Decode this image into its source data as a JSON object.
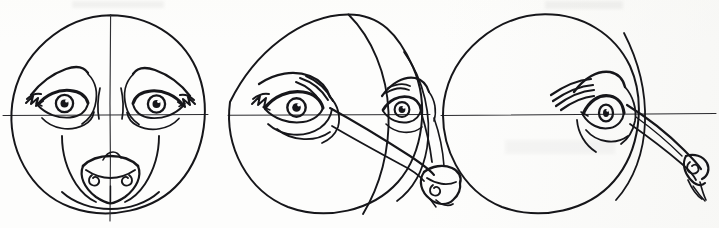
{
  "document": {
    "title": "Canine Head Construction Sketch",
    "medium": "pen and ink on paper",
    "subject": "wolf / dog head turnaround study",
    "panel_count": 3,
    "background_color": "#fdfdfc",
    "ink_color": "#16161a",
    "guide_color": "#2a2a2e",
    "canvas": {
      "width": 719,
      "height": 228
    }
  },
  "guides": {
    "eye_line_label": "horizontal eye line",
    "eye_line_y": 115,
    "eye_line_x_start": 3,
    "eye_line_x_end": 716,
    "center_line_label": "vertical center line"
  },
  "panels": [
    {
      "id": "panel-1",
      "view": "front view",
      "rotation_degrees": 0,
      "circle": {
        "cx": 110,
        "cy": 114,
        "r": 99
      },
      "center_line": {
        "type": "straight",
        "x_top": 110,
        "x_bottom": 110
      },
      "features": [
        "left eye",
        "right eye",
        "left brow",
        "right brow",
        "muzzle",
        "nose",
        "cheek lines"
      ],
      "eyes_visible": 2,
      "nose_visible": true
    },
    {
      "id": "panel-2",
      "view": "three-quarter view",
      "rotation_degrees": 45,
      "circle": {
        "cx": 327,
        "cy": 114,
        "r": 99
      },
      "center_line": {
        "type": "curved",
        "x_top": 348,
        "x_mid": 389,
        "x_bottom": 363
      },
      "features": [
        "near eye",
        "far eye",
        "near brow",
        "far brow",
        "muzzle",
        "nose",
        "jaw line"
      ],
      "eyes_visible": 2,
      "nose_visible": true
    },
    {
      "id": "panel-3",
      "view": "profile view",
      "rotation_degrees": 90,
      "circle": {
        "cx": 545,
        "cy": 114,
        "r": 101
      },
      "center_line": {
        "type": "edge",
        "x_top": 625,
        "x_bottom": 600
      },
      "features": [
        "single eye",
        "brow",
        "brow hatching",
        "long muzzle",
        "nose",
        "jaw line"
      ],
      "eyes_visible": 1,
      "nose_visible": true
    }
  ],
  "annotations": {
    "smudge_top_left": "faint pencil smudge",
    "smudge_top_right": "faint pencil smudge",
    "smudge_mid_right": "faint paper stain"
  }
}
